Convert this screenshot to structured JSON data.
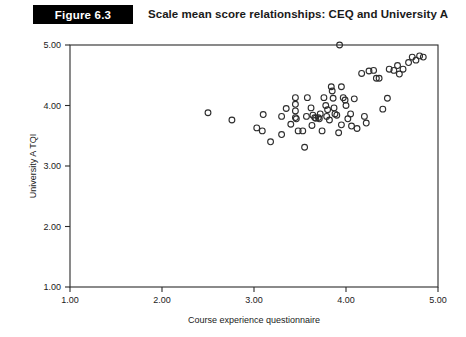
{
  "figure": {
    "badge_label": "Figure 6.3",
    "title": "Scale mean score relationships: CEQ and University A"
  },
  "chart_data": {
    "type": "scatter",
    "title": "Scale mean score relationships: CEQ and University A",
    "xlabel": "Course experience questionnaire",
    "ylabel": "University A TQI",
    "xlim": [
      1.0,
      5.0
    ],
    "ylim": [
      1.0,
      5.0
    ],
    "xticks": [
      1.0,
      2.0,
      3.0,
      4.0,
      5.0
    ],
    "yticks": [
      1.0,
      2.0,
      3.0,
      4.0,
      5.0
    ],
    "xticklabels": [
      "1.00",
      "2.00",
      "3.00",
      "4.00",
      "5.00"
    ],
    "yticklabels": [
      "1.00",
      "2.00",
      "3.00",
      "4.00",
      "5.00"
    ],
    "grid": false,
    "legend": false,
    "marker": "open-circle",
    "marker_color": "#2d2d2d",
    "n_points": 71,
    "points": [
      [
        2.5,
        3.88
      ],
      [
        2.76,
        3.76
      ],
      [
        3.03,
        3.63
      ],
      [
        3.09,
        3.58
      ],
      [
        3.1,
        3.85
      ],
      [
        3.18,
        3.4
      ],
      [
        3.3,
        3.82
      ],
      [
        3.45,
        4.13
      ],
      [
        3.45,
        4.02
      ],
      [
        3.45,
        3.91
      ],
      [
        3.45,
        3.8
      ],
      [
        3.46,
        3.78
      ],
      [
        3.48,
        3.58
      ],
      [
        3.53,
        3.58
      ],
      [
        3.55,
        3.31
      ],
      [
        3.57,
        3.82
      ],
      [
        3.58,
        4.13
      ],
      [
        3.62,
        3.96
      ],
      [
        3.64,
        3.84
      ],
      [
        3.66,
        3.8
      ],
      [
        3.67,
        3.79
      ],
      [
        3.7,
        3.8
      ],
      [
        3.71,
        3.78
      ],
      [
        3.72,
        3.86
      ],
      [
        3.74,
        3.58
      ],
      [
        3.76,
        4.13
      ],
      [
        3.78,
        4.0
      ],
      [
        3.79,
        3.82
      ],
      [
        3.8,
        3.93
      ],
      [
        3.82,
        3.76
      ],
      [
        3.84,
        4.31
      ],
      [
        3.85,
        4.24
      ],
      [
        3.86,
        4.12
      ],
      [
        3.87,
        3.96
      ],
      [
        3.88,
        3.86
      ],
      [
        3.9,
        3.84
      ],
      [
        3.92,
        3.55
      ],
      [
        3.93,
        5.0
      ],
      [
        3.95,
        4.31
      ],
      [
        3.97,
        4.13
      ],
      [
        3.99,
        4.09
      ],
      [
        4.0,
        4.0
      ],
      [
        4.02,
        3.78
      ],
      [
        4.06,
        3.66
      ],
      [
        4.09,
        4.11
      ],
      [
        4.12,
        3.62
      ],
      [
        4.17,
        4.53
      ],
      [
        4.2,
        3.82
      ],
      [
        4.22,
        3.71
      ],
      [
        4.25,
        4.57
      ],
      [
        4.3,
        4.58
      ],
      [
        4.33,
        4.45
      ],
      [
        4.36,
        4.45
      ],
      [
        4.4,
        3.94
      ],
      [
        4.47,
        4.6
      ],
      [
        4.52,
        4.58
      ],
      [
        4.56,
        4.66
      ],
      [
        4.58,
        4.52
      ],
      [
        4.62,
        4.6
      ],
      [
        4.68,
        4.71
      ],
      [
        4.72,
        4.8
      ],
      [
        4.76,
        4.75
      ],
      [
        4.8,
        4.82
      ],
      [
        4.84,
        4.8
      ],
      [
        3.35,
        3.95
      ],
      [
        3.4,
        3.69
      ],
      [
        3.63,
        3.67
      ],
      [
        3.95,
        3.68
      ],
      [
        4.05,
        3.86
      ],
      [
        4.45,
        4.12
      ],
      [
        3.3,
        3.52
      ]
    ]
  }
}
